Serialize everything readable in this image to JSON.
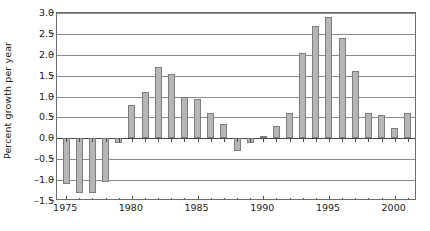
{
  "chart_data": {
    "type": "bar",
    "title": "",
    "subtitle": "",
    "xlabel": "",
    "ylabel": "Percent growth per year",
    "ylim": [
      -1.5,
      3.0
    ],
    "xlim": [
      1974.3,
      2001.7
    ],
    "ytick_labels": [
      "3.0",
      "2.5",
      "2.0",
      "1.5",
      "1.0",
      "0.5",
      "0.0",
      "–0.5",
      "–1.0",
      "–1.5"
    ],
    "ytick_values": [
      3.0,
      2.5,
      2.0,
      1.5,
      1.0,
      0.5,
      0.0,
      -0.5,
      -1.0,
      -1.5
    ],
    "xtick_labels": [
      "1975",
      "1980",
      "1985",
      "1990",
      "1995",
      "2000"
    ],
    "xtick_values": [
      1975,
      1980,
      1985,
      1990,
      1995,
      2000
    ],
    "x_minor_ticks_every": 1,
    "grid": "horizontal",
    "legend": "none",
    "bar_color": "#b6b6b6",
    "bar_edge_color": "#7d7d7d",
    "axis_color": "#6d6d6d",
    "grid_color": "#8a8a8a",
    "categories": [
      1975,
      1976,
      1977,
      1978,
      1979,
      1980,
      1981,
      1982,
      1983,
      1984,
      1985,
      1986,
      1987,
      1988,
      1989,
      1990,
      1991,
      1992,
      1993,
      1994,
      1995,
      1996,
      1997,
      1998,
      1999,
      2000,
      2001
    ],
    "values": [
      -1.1,
      -1.3,
      -1.3,
      -1.05,
      -0.1,
      0.8,
      1.1,
      1.7,
      1.55,
      1.0,
      0.95,
      0.6,
      0.35,
      -0.3,
      -0.1,
      0.05,
      0.3,
      0.6,
      2.05,
      2.7,
      2.9,
      2.4,
      1.6,
      0.6,
      0.55,
      0.25,
      0.6
    ]
  }
}
